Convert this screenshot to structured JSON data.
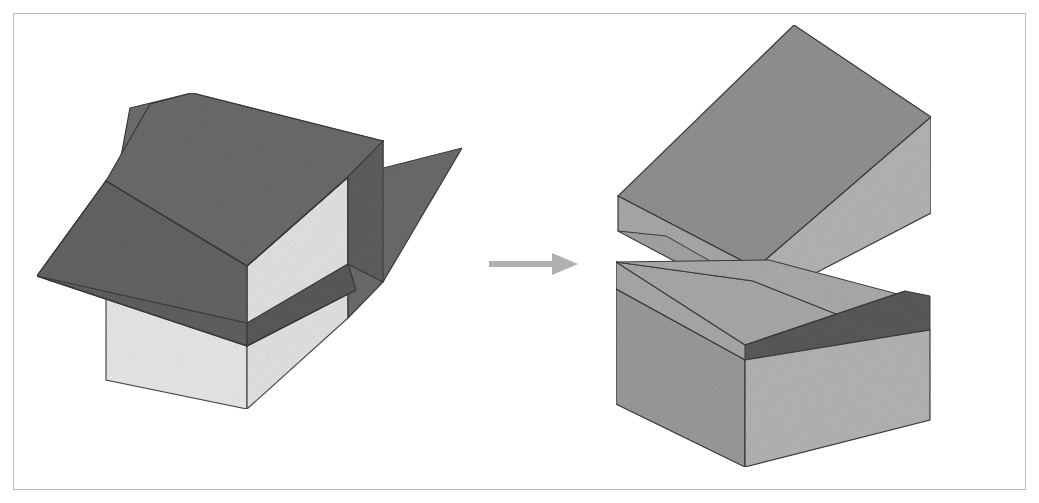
{
  "figure": {
    "title": "Exploded solid split into two halves",
    "background_color": "#ffffff",
    "frame": {
      "border_color": "#b9b9b9",
      "border_width_px": 1,
      "inset_px": 13
    },
    "palette": {
      "dark_gray": "#6b6b6b",
      "mid_dark_gray": "#5a5a5a",
      "medium_gray": "#919191",
      "light_medium_gray": "#a9a9a9",
      "lighter_gray": "#b4b4b4",
      "pale_gray": "#e8e8e8",
      "outline": "#3a3a3a",
      "arrow_gray": "#b0b0b0"
    },
    "arrow": {
      "name": "transformation-arrow",
      "direction": "right",
      "color": "#b0b0b0",
      "x_start": 489,
      "x_end": 572,
      "y": 264
    },
    "panels": [
      {
        "name": "left-panel",
        "label": "assembled-solid-with-wedge",
        "parts": [
          {
            "name": "base-cube",
            "face": "front-left",
            "fill": "#e8e8e8"
          },
          {
            "name": "base-cube",
            "face": "right",
            "fill": "#6b6b6b"
          },
          {
            "name": "wedge-flap",
            "face": "top",
            "fill": "#6b6b6b"
          },
          {
            "name": "wedge-flap",
            "face": "underside-v",
            "fill": "#5a5a5a"
          },
          {
            "name": "wedge-wing",
            "face": "right-wing",
            "fill": "#6b6b6b"
          }
        ]
      },
      {
        "name": "right-panel",
        "label": "separated-solid-two-blocks",
        "parts": [
          {
            "name": "upper-block",
            "face": "top",
            "fill": "#919191"
          },
          {
            "name": "upper-block",
            "face": "front-left",
            "fill": "#a9a9a9"
          },
          {
            "name": "upper-block",
            "face": "front-right",
            "fill": "#b4b4b4"
          },
          {
            "name": "lower-block",
            "face": "top-slope",
            "fill": "#a9a9a9"
          },
          {
            "name": "lower-block",
            "face": "notch",
            "fill": "#5a5a5a"
          },
          {
            "name": "lower-block",
            "face": "front-left",
            "fill": "#9b9b9b"
          },
          {
            "name": "lower-block",
            "face": "front-right",
            "fill": "#b4b4b4"
          }
        ]
      }
    ]
  },
  "chart_data": {
    "type": "diagram",
    "elements": [
      {
        "id": "left-assembly",
        "kind": "3d-solid",
        "state": "assembled",
        "position": "left"
      },
      {
        "id": "arrow",
        "kind": "arrow",
        "direction": "right",
        "position": "center"
      },
      {
        "id": "right-assembly",
        "kind": "3d-solid",
        "state": "separated",
        "position": "right",
        "piece_count": 2
      }
    ]
  }
}
